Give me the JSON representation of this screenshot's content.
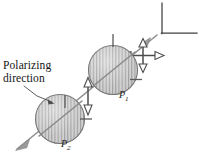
{
  "figure": {
    "background_color": "#ffffff",
    "width": 199,
    "height": 160,
    "annotations": {
      "polarizing_direction_line1": "Polarizing",
      "polarizing_direction_line2": "direction",
      "label_p1_letter": "P",
      "label_p1_subscript": "1",
      "label_p2_letter": "P",
      "label_p2_subscript": "2"
    },
    "colors": {
      "disk_fill": "#c9c9c9",
      "disk_hatch": "#8f8f8f",
      "disk_outline": "#6e6e6e",
      "beam_line": "#8a8a8a",
      "arrow_stroke": "#4a4a4a",
      "tick_mark": "#5a5a5a",
      "frame_line": "#3f3f3f",
      "text": "#141414"
    },
    "elements": [
      {
        "name": "source-frame-bracket",
        "type": "corner-bracket",
        "description": "L-shaped corner bracket at upper right"
      },
      {
        "name": "unpolarized-light-symbol",
        "type": "four-way-double-arrow",
        "description": "Cross of double-headed arrows indicating unpolarized light"
      },
      {
        "name": "polarizer-disk-p1",
        "type": "hatched-circle",
        "description": "First polarizing filter with vertical transmission hatching"
      },
      {
        "name": "polarizer-disk-p2",
        "type": "hatched-circle",
        "description": "Second polarizing filter with vertical transmission hatching"
      },
      {
        "name": "polarized-light-arrow",
        "type": "vertical-double-arrow",
        "description": "Vertical double-headed arrow between filters showing linear polarization"
      },
      {
        "name": "beam-axis-line",
        "type": "diagonal-line-with-arrowhead",
        "description": "Light beam travelling from upper right to lower left"
      },
      {
        "name": "leader-line-polarizing-direction",
        "type": "callout-leader",
        "description": "Leader from caption to polarizing direction hatching"
      }
    ]
  }
}
